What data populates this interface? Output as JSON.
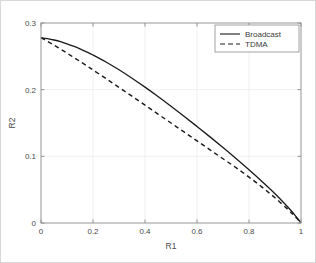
{
  "chart_data": {
    "type": "line",
    "title": "",
    "xlabel": "R1",
    "ylabel": "R2",
    "xlim": [
      0,
      1
    ],
    "ylim": [
      0,
      0.3
    ],
    "xticks": [
      "0",
      "0.2",
      "0.4",
      "0.6",
      "0.8",
      "1"
    ],
    "xtick_values": [
      0,
      0.2,
      0.4,
      0.6,
      0.8,
      1
    ],
    "yticks": [
      "0",
      "0.1",
      "0.2",
      "0.3"
    ],
    "ytick_values": [
      0,
      0.1,
      0.2,
      0.3
    ],
    "grid": true,
    "legend_position": "top-right",
    "series": [
      {
        "name": "Broadcast",
        "style": "solid",
        "color": "#1a1a1a",
        "x": [
          0.0,
          0.025,
          0.05,
          0.075,
          0.1,
          0.125,
          0.15,
          0.175,
          0.2,
          0.25,
          0.3,
          0.35,
          0.4,
          0.45,
          0.5,
          0.55,
          0.6,
          0.65,
          0.7,
          0.75,
          0.8,
          0.85,
          0.9,
          0.95,
          0.975,
          1.0
        ],
        "y": [
          0.278,
          0.2765,
          0.2745,
          0.272,
          0.2688,
          0.2652,
          0.2612,
          0.2568,
          0.252,
          0.2415,
          0.2298,
          0.2172,
          0.2038,
          0.1898,
          0.1752,
          0.1602,
          0.1448,
          0.1292,
          0.1132,
          0.0968,
          0.0798,
          0.0622,
          0.0438,
          0.0236,
          0.0126,
          0.0
        ]
      },
      {
        "name": "TDMA",
        "style": "dashed",
        "color": "#1a1a1a",
        "x": [
          0.0,
          0.025,
          0.05,
          0.075,
          0.1,
          0.125,
          0.15,
          0.175,
          0.2,
          0.25,
          0.3,
          0.35,
          0.4,
          0.45,
          0.5,
          0.55,
          0.6,
          0.65,
          0.7,
          0.75,
          0.8,
          0.85,
          0.9,
          0.95,
          0.975,
          1.0
        ],
        "y": [
          0.278,
          0.2725,
          0.2668,
          0.2608,
          0.2548,
          0.2486,
          0.2424,
          0.236,
          0.2296,
          0.2166,
          0.2034,
          0.1902,
          0.1768,
          0.1634,
          0.15,
          0.1366,
          0.1232,
          0.1098,
          0.0964,
          0.083,
          0.0688,
          0.0538,
          0.0378,
          0.0202,
          0.0106,
          0.0
        ]
      }
    ],
    "legend_entries": [
      {
        "label": "Broadcast",
        "style": "solid"
      },
      {
        "label": "TDMA",
        "style": "dashed"
      }
    ]
  }
}
